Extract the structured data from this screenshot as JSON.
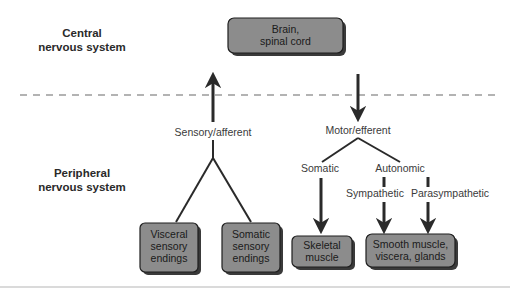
{
  "diagram": {
    "sections": {
      "central": {
        "line1": "Central",
        "line2": "nervous system"
      },
      "peripheral": {
        "line1": "Peripheral",
        "line2": "nervous system"
      }
    },
    "nodes": {
      "brain": {
        "line1": "Brain,",
        "line2": "spinal cord"
      },
      "visceral": {
        "line1": "Visceral",
        "line2": "sensory",
        "line3": "endings"
      },
      "somatic_sensory": {
        "line1": "Somatic",
        "line2": "sensory",
        "line3": "endings"
      },
      "skeletal": {
        "line1": "Skeletal",
        "line2": "muscle"
      },
      "smooth": {
        "line1": "Smooth muscle,",
        "line2": "viscera, glands"
      }
    },
    "labels": {
      "sensory": "Sensory/afferent",
      "motor": "Motor/efferent",
      "somatic": "Somatic",
      "autonomic": "Autonomic",
      "sympathetic": "Sympathetic",
      "parasympathetic": "Parasympathetic"
    },
    "colors": {
      "box_fill": "#8c8c8c",
      "box_stroke": "#1e1e1e",
      "shadow": "#3a3a3a",
      "arrow": "#2a2a2a",
      "divider": "#9a9a9a"
    }
  }
}
